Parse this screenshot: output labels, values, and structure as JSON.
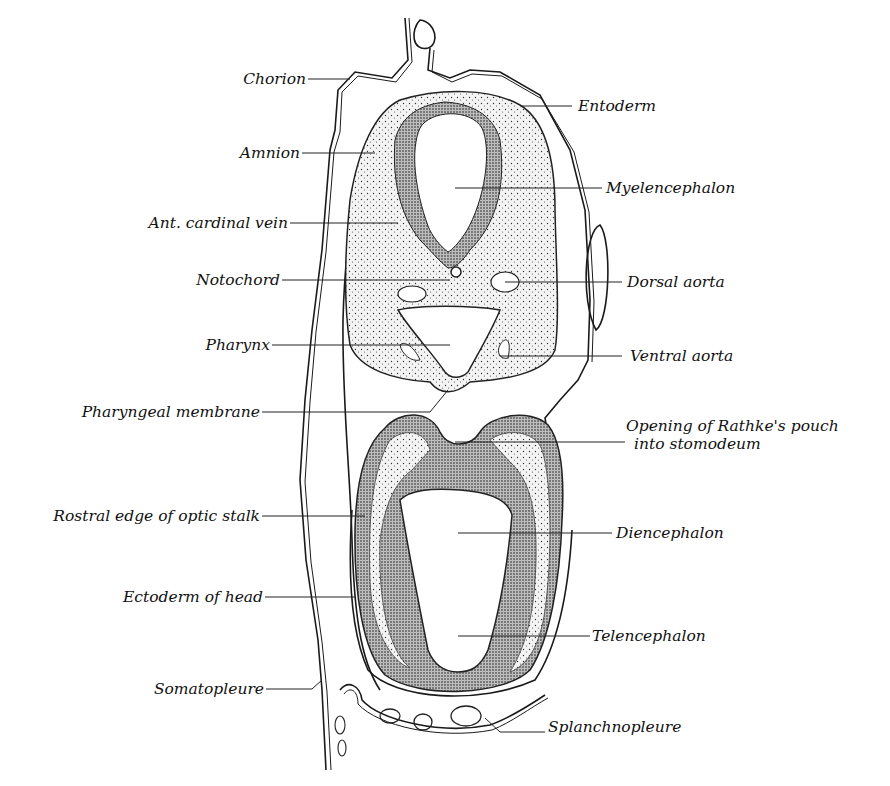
{
  "figure": {
    "labels_left": [
      {
        "id": "chorion",
        "text": "Chorion"
      },
      {
        "id": "amnion",
        "text": "Amnion"
      },
      {
        "id": "ant-cardinal-vein",
        "text": "Ant. cardinal vein"
      },
      {
        "id": "notochord",
        "text": "Notochord"
      },
      {
        "id": "pharynx",
        "text": "Pharynx"
      },
      {
        "id": "pharyngeal-membrane",
        "text": "Pharyngeal membrane"
      },
      {
        "id": "rostral-edge-optic-stalk",
        "text": "Rostral edge of optic stalk"
      },
      {
        "id": "ectoderm-of-head",
        "text": "Ectoderm of head"
      },
      {
        "id": "somatopleure",
        "text": "Somatopleure"
      }
    ],
    "labels_right": [
      {
        "id": "entoderm",
        "text": "Entoderm"
      },
      {
        "id": "myelencephalon",
        "text": "Myelencephalon"
      },
      {
        "id": "dorsal-aorta",
        "text": "Dorsal aorta"
      },
      {
        "id": "ventral-aorta",
        "text": "Ventral aorta"
      },
      {
        "id": "rathkes-pouch-line1",
        "text": "Opening of Rathke's pouch"
      },
      {
        "id": "rathkes-pouch-line2",
        "text": "into stomodeum"
      },
      {
        "id": "diencephalon",
        "text": "Diencephalon"
      },
      {
        "id": "telencephalon",
        "text": "Telencephalon"
      },
      {
        "id": "splanchnopleure",
        "text": "Splanchnopleure"
      }
    ]
  }
}
